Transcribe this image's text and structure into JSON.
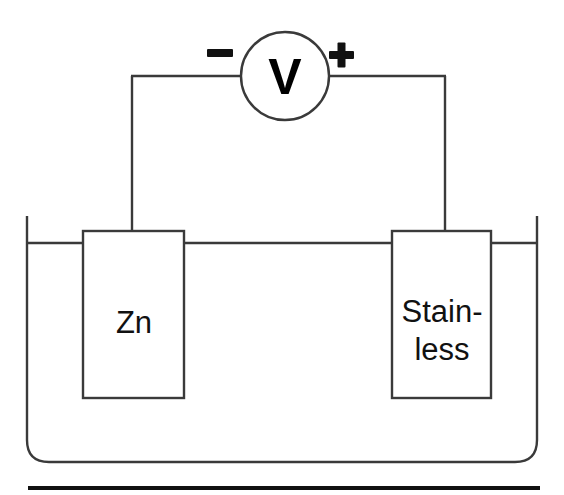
{
  "figure": {
    "type": "galvanic-cell-diagram",
    "background_color": "#ffffff",
    "line_color": "#3a3a3a",
    "ink_color": "#111111"
  },
  "voltmeter": {
    "symbol": "V",
    "negative_terminal": "−",
    "positive_terminal": "+",
    "center_x": 285,
    "center_y": 76,
    "radius": 44
  },
  "electrodes": [
    {
      "id": "left-electrode",
      "name": "zinc-electrode",
      "label_lines": [
        "Zn"
      ],
      "terminal": "negative",
      "x": 83,
      "y": 231,
      "width": 101,
      "height": 167
    },
    {
      "id": "right-electrode",
      "name": "stainless-steel-electrode",
      "label_lines": [
        "Stain-",
        "less"
      ],
      "terminal": "positive",
      "x": 392,
      "y": 231,
      "width": 99,
      "height": 167
    }
  ],
  "beaker": {
    "name": "electrolyte-beaker",
    "left": 27,
    "right": 537,
    "top": 216,
    "bottom": 462,
    "corner_radius": 22,
    "liquid_level_y": 243
  },
  "wires": {
    "left_wire_x": 132,
    "right_wire_x": 445,
    "top_wire_y": 76
  },
  "baseline_rule": {
    "name": "bottom-rule",
    "x_start": 28,
    "x_end": 540,
    "y": 488,
    "thickness": 4
  }
}
